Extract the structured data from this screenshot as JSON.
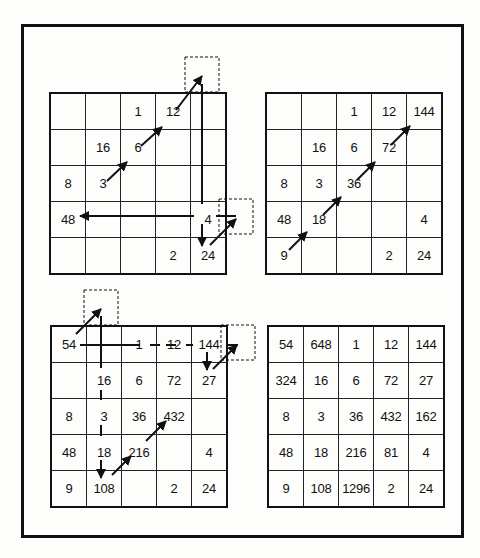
{
  "grids": [
    {
      "name": "step-1-partial-square",
      "rows": [
        [
          "",
          "",
          "1",
          "12",
          ""
        ],
        [
          "",
          "16",
          "6",
          "",
          ""
        ],
        [
          "8",
          "3",
          "",
          "",
          ""
        ],
        [
          "48",
          "",
          "",
          "",
          "4"
        ],
        [
          "",
          "",
          "",
          "2",
          "24"
        ]
      ]
    },
    {
      "name": "step-2-diagonal-filled",
      "rows": [
        [
          "",
          "",
          "1",
          "12",
          "144"
        ],
        [
          "",
          "16",
          "6",
          "72",
          ""
        ],
        [
          "8",
          "3",
          "36",
          "",
          ""
        ],
        [
          "48",
          "18",
          "",
          "",
          "4"
        ],
        [
          "9",
          "",
          "",
          "2",
          "24"
        ]
      ]
    },
    {
      "name": "step-3-wraparound",
      "rows": [
        [
          "54",
          "",
          "1",
          "12",
          "144"
        ],
        [
          "",
          "16",
          "6",
          "72",
          "27"
        ],
        [
          "8",
          "3",
          "36",
          "432",
          ""
        ],
        [
          "48",
          "18",
          "216",
          "",
          "4"
        ],
        [
          "9",
          "108",
          "",
          "2",
          "24"
        ]
      ]
    },
    {
      "name": "step-4-completed-square",
      "rows": [
        [
          "54",
          "648",
          "1",
          "12",
          "144"
        ],
        [
          "324",
          "16",
          "6",
          "72",
          "27"
        ],
        [
          "8",
          "3",
          "36",
          "432",
          "162"
        ],
        [
          "48",
          "18",
          "216",
          "81",
          "4"
        ],
        [
          "9",
          "108",
          "1296",
          "2",
          "24"
        ]
      ]
    }
  ],
  "colors": {
    "ink": "#111111",
    "paper": "#fdfdfb"
  }
}
